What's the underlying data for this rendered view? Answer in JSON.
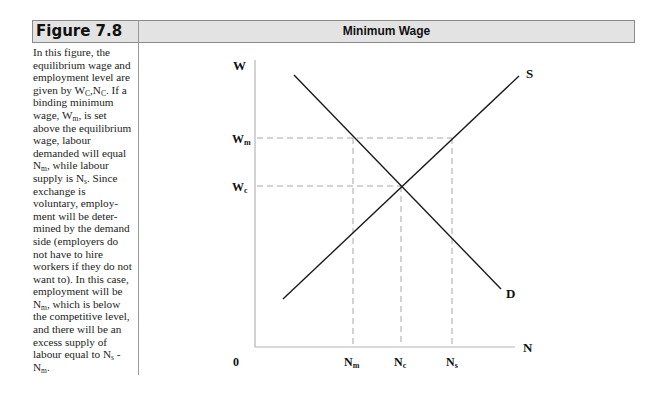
{
  "figure": {
    "label": "Figure 7.8",
    "title": "Minimum Wage"
  },
  "caption": {
    "segments": [
      {
        "t": "In this figure, the equilibrium wage and employment level are given by W"
      },
      {
        "sub": "C"
      },
      {
        "t": ",N"
      },
      {
        "sub": "C"
      },
      {
        "t": ". If a binding minimum wage, W"
      },
      {
        "sub": "m"
      },
      {
        "t": ", is set above the equilibrium wage, labour demanded will equal N"
      },
      {
        "sub": "m"
      },
      {
        "t": ", while labour supply is N"
      },
      {
        "sub": "s"
      },
      {
        "t": ". Since exchange is voluntary, employ-ment will be deter-mined by the demand side (employers do not have to hire workers if they do not want to). In this case, employment will be N"
      },
      {
        "sub": "m"
      },
      {
        "t": ", which is below the competitive level, and there will be an excess supply of labour equal to N"
      },
      {
        "sub": "s"
      },
      {
        "t": " - N"
      },
      {
        "sub": "m"
      },
      {
        "t": "."
      }
    ]
  },
  "axes": {
    "y_label": "W",
    "x_label": "N",
    "origin_label": "0"
  },
  "labels": {
    "W_m": {
      "main": "W",
      "sub": "m"
    },
    "W_c": {
      "main": "W",
      "sub": "c"
    },
    "N_m": {
      "main": "N",
      "sub": "m"
    },
    "N_c": {
      "main": "N",
      "sub": "c"
    },
    "N_s": {
      "main": "N",
      "sub": "s"
    },
    "supply": "S",
    "demand": "D"
  },
  "chart_data": {
    "type": "line",
    "title": "Minimum Wage",
    "xlabel": "N",
    "ylabel": "W",
    "grid": false,
    "legend": "none",
    "series": [
      {
        "name": "S",
        "description": "labour supply (upward sloping)",
        "points": [
          [
            0.12,
            0.25
          ],
          [
            1.0,
            1.07
          ]
        ]
      },
      {
        "name": "D",
        "description": "labour demand (downward sloping)",
        "points": [
          [
            0.15,
            1.02
          ],
          [
            0.98,
            0.2
          ]
        ]
      }
    ],
    "reference_lines": [
      {
        "name": "W_m",
        "axis": "y",
        "value": 0.73,
        "style": "dashed",
        "from_x": 0,
        "to_x": 0.8
      },
      {
        "name": "W_c",
        "axis": "y",
        "value": 0.56,
        "style": "dashed",
        "from_x": 0,
        "to_x": 0.6
      },
      {
        "name": "N_m",
        "axis": "x",
        "value": 0.42,
        "style": "dashed",
        "to_y": 0.73
      },
      {
        "name": "N_c",
        "axis": "x",
        "value": 0.6,
        "style": "dashed",
        "to_y": 0.56
      },
      {
        "name": "N_s",
        "axis": "x",
        "value": 0.8,
        "style": "dashed",
        "to_y": 0.73
      }
    ],
    "equilibrium": {
      "N": "N_c",
      "W": "W_c"
    },
    "x_ticks": [
      "0",
      "Nm",
      "Nc",
      "Ns"
    ],
    "y_ticks": [
      "Wc",
      "Wm"
    ]
  }
}
